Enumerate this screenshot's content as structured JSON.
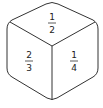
{
  "diagram": {
    "type": "cube",
    "faces": {
      "top": {
        "numerator": "1",
        "denominator": "2"
      },
      "left": {
        "numerator": "2",
        "denominator": "3"
      },
      "right": {
        "numerator": "1",
        "denominator": "4"
      }
    },
    "stroke_color": "#333333"
  }
}
